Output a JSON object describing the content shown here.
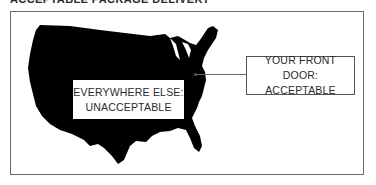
{
  "title": "ACCEPTABLE PACKAGE DELIVERY",
  "diagram": {
    "map_region": "United States (contiguous)",
    "map_fill": "#000000",
    "frame_color": "#6a6a6a",
    "labels": {
      "everywhere_else": {
        "line1": "EVERYWHERE ELSE:",
        "line2": "UNACCEPTABLE"
      },
      "front_door": {
        "line1": "YOUR FRONT DOOR:",
        "line2": "ACCEPTABLE"
      }
    }
  }
}
